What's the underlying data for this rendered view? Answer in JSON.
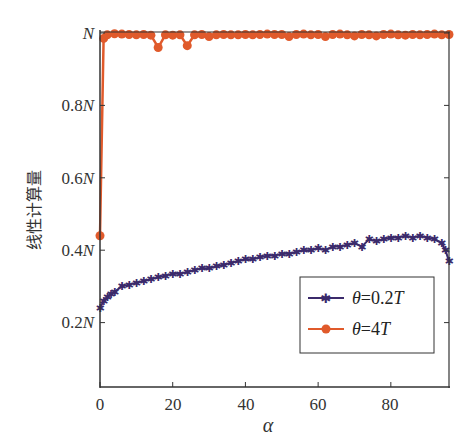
{
  "chart_data": {
    "type": "line",
    "title": "",
    "xlabel": "α",
    "ylabel": "线性计算量",
    "xlim": [
      0,
      96
    ],
    "ylim": [
      0.02,
      1.0
    ],
    "y_unit": "N",
    "grid": false,
    "legend_position": "lower right",
    "x_ticks": [
      0,
      20,
      40,
      60,
      80
    ],
    "x_tick_labels": [
      "0",
      "20",
      "40",
      "60",
      "80"
    ],
    "y_ticks": [
      0.2,
      0.4,
      0.6,
      0.8,
      1.0
    ],
    "y_tick_labels": [
      "0.2N",
      "0.4N",
      "0.6N",
      "0.8N",
      "N"
    ],
    "series": [
      {
        "name": "θ=0.2T",
        "color": "#3b2a6b",
        "marker": "star",
        "x": [
          0,
          1,
          2,
          3,
          4,
          6,
          8,
          10,
          12,
          14,
          16,
          18,
          20,
          22,
          24,
          26,
          28,
          30,
          32,
          34,
          36,
          38,
          40,
          42,
          44,
          46,
          48,
          50,
          52,
          54,
          56,
          58,
          60,
          62,
          64,
          66,
          68,
          70,
          72,
          74,
          76,
          78,
          80,
          82,
          84,
          86,
          88,
          90,
          92,
          94,
          95,
          96
        ],
        "values": [
          0.24,
          0.26,
          0.27,
          0.28,
          0.285,
          0.3,
          0.305,
          0.31,
          0.315,
          0.32,
          0.325,
          0.33,
          0.335,
          0.335,
          0.34,
          0.345,
          0.35,
          0.35,
          0.355,
          0.36,
          0.365,
          0.37,
          0.375,
          0.375,
          0.38,
          0.385,
          0.385,
          0.39,
          0.39,
          0.395,
          0.4,
          0.4,
          0.405,
          0.4,
          0.41,
          0.41,
          0.415,
          0.42,
          0.41,
          0.43,
          0.425,
          0.43,
          0.435,
          0.435,
          0.44,
          0.435,
          0.44,
          0.435,
          0.43,
          0.42,
          0.4,
          0.37
        ]
      },
      {
        "name": "θ=4T",
        "color": "#e05a2b",
        "marker": "circle",
        "x": [
          0,
          1,
          2,
          4,
          6,
          8,
          10,
          12,
          14,
          16,
          18,
          20,
          22,
          24,
          26,
          28,
          30,
          32,
          34,
          36,
          38,
          40,
          42,
          44,
          46,
          48,
          50,
          52,
          54,
          56,
          58,
          60,
          62,
          64,
          66,
          68,
          70,
          72,
          74,
          76,
          78,
          80,
          82,
          84,
          86,
          88,
          90,
          92,
          94,
          96
        ],
        "values": [
          0.44,
          0.985,
          0.995,
          0.998,
          0.997,
          0.996,
          0.995,
          0.996,
          0.994,
          0.96,
          0.995,
          0.994,
          0.995,
          0.965,
          0.995,
          0.996,
          0.99,
          0.995,
          0.996,
          0.995,
          0.995,
          0.996,
          0.995,
          0.996,
          0.997,
          0.996,
          0.996,
          0.99,
          0.996,
          0.997,
          0.995,
          0.996,
          0.99,
          0.996,
          0.997,
          0.995,
          0.992,
          0.996,
          0.995,
          0.992,
          0.996,
          0.997,
          0.995,
          0.994,
          0.996,
          0.995,
          0.996,
          0.997,
          0.995,
          0.996
        ]
      }
    ]
  },
  "axes": {
    "xlabel": "α",
    "ylabel": "线性计算量",
    "x_tick_labels": [
      "0",
      "20",
      "40",
      "60",
      "80"
    ],
    "y_tick_labels": [
      {
        "num": "0.2",
        "unit": "N"
      },
      {
        "num": "0.4",
        "unit": "N"
      },
      {
        "num": "0.6",
        "unit": "N"
      },
      {
        "num": "0.8",
        "unit": "N"
      },
      {
        "num": "",
        "unit": "N"
      }
    ]
  },
  "legend": {
    "entries": [
      {
        "label_sym": "θ",
        "label_rest": "=0.2",
        "label_unit": "T",
        "color": "#3b2a6b",
        "marker": "star"
      },
      {
        "label_sym": "θ",
        "label_rest": "=4",
        "label_unit": "T",
        "color": "#e05a2b",
        "marker": "circle"
      }
    ]
  }
}
